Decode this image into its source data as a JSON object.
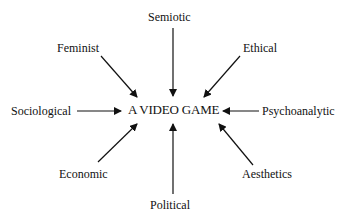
{
  "diagram": {
    "center": "A VIDEO GAME",
    "perspectives": [
      {
        "id": "semiotic",
        "label": "Semiotic"
      },
      {
        "id": "ethical",
        "label": "Ethical"
      },
      {
        "id": "psychoanalytic",
        "label": "Psychoanalytic"
      },
      {
        "id": "aesthetics",
        "label": "Aesthetics"
      },
      {
        "id": "political",
        "label": "Political"
      },
      {
        "id": "economic",
        "label": "Economic"
      },
      {
        "id": "sociological",
        "label": "Sociological"
      },
      {
        "id": "feminist",
        "label": "Feminist"
      }
    ],
    "arrow_color": "#111111"
  }
}
